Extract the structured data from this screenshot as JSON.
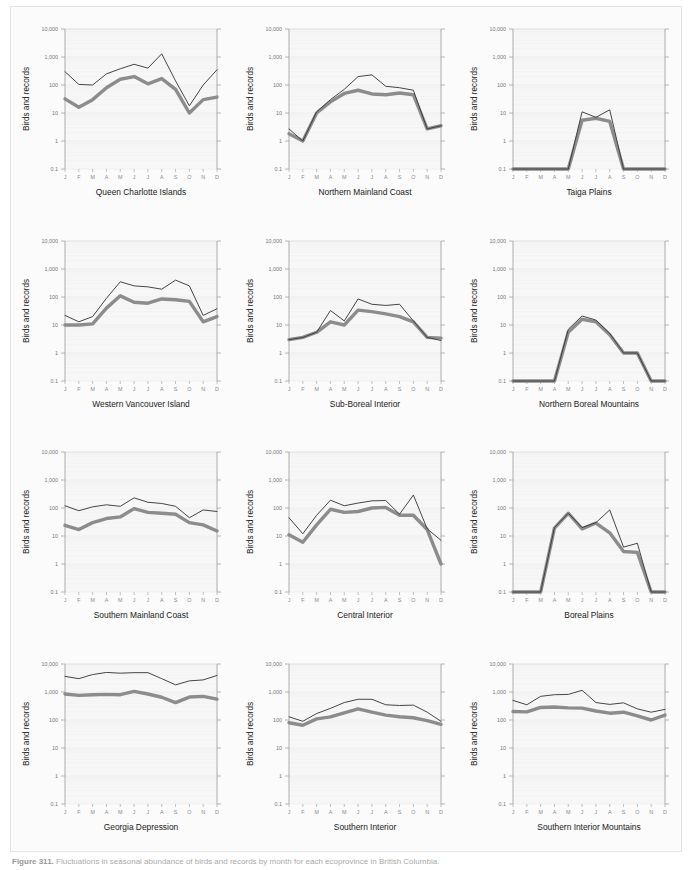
{
  "figure": {
    "caption_number": "Figure 311.",
    "caption_text": "Fluctuations in seasonal abundance of birds and records by month for each ecoprovince in British Columbia.",
    "y_axis_label": "Birds and records",
    "y_ticks": [
      "10,000",
      "1,000",
      "100",
      "10",
      "1",
      "0.1"
    ],
    "y_values": [
      10000,
      1000,
      100,
      10,
      1,
      0.1
    ],
    "x_ticks": [
      "J",
      "F",
      "M",
      "A",
      "M",
      "J",
      "J",
      "A",
      "S",
      "O",
      "N",
      "D"
    ],
    "colors": {
      "records_line": "#3b3b3b",
      "birds_line": "#8c8c8c",
      "panel_background": "#f7f7f7",
      "grid": "#ebebeb",
      "axis": "#9a9a9a"
    },
    "series_names": {
      "thin": "Records",
      "thick": "Birds"
    }
  },
  "chart_data": [
    {
      "type": "line",
      "title": "Queen Charlotte Islands",
      "xlabel": "",
      "ylabel": "Birds and records",
      "ylim": [
        0.1,
        10000
      ],
      "yscale": "log",
      "grid": true,
      "categories": [
        "J",
        "F",
        "M",
        "A",
        "M",
        "J",
        "J",
        "A",
        "S",
        "O",
        "N",
        "D"
      ],
      "series": [
        {
          "name": "Records",
          "values": [
            300,
            105,
            100,
            250,
            380,
            550,
            400,
            1300,
            140,
            18,
            100,
            350
          ]
        },
        {
          "name": "Birds",
          "values": [
            32,
            16,
            30,
            80,
            160,
            200,
            110,
            170,
            70,
            10,
            30,
            37
          ]
        }
      ]
    },
    {
      "type": "line",
      "title": "Northern Mainland Coast",
      "xlabel": "",
      "ylabel": "Birds and records",
      "ylim": [
        0.1,
        10000
      ],
      "yscale": "log",
      "grid": true,
      "categories": [
        "J",
        "F",
        "M",
        "A",
        "M",
        "J",
        "J",
        "A",
        "S",
        "O",
        "N",
        "D"
      ],
      "series": [
        {
          "name": "Records",
          "values": [
            2.7,
            1.0,
            11,
            30,
            70,
            200,
            230,
            90,
            80,
            65,
            2.7,
            3.5
          ]
        },
        {
          "name": "Birds",
          "values": [
            1.8,
            1.0,
            10,
            25,
            50,
            65,
            48,
            45,
            52,
            45,
            2.7,
            3.5
          ]
        }
      ]
    },
    {
      "type": "line",
      "title": "Taiga Plains",
      "xlabel": "",
      "ylabel": "Birds and records",
      "ylim": [
        0.1,
        10000
      ],
      "yscale": "log",
      "grid": true,
      "categories": [
        "J",
        "F",
        "M",
        "A",
        "M",
        "J",
        "J",
        "A",
        "S",
        "O",
        "N",
        "D"
      ],
      "series": [
        {
          "name": "Records",
          "values": [
            0.1,
            0.1,
            0.1,
            0.1,
            0.1,
            11,
            7,
            13,
            0.1,
            0.1,
            0.1,
            0.1
          ]
        },
        {
          "name": "Birds",
          "values": [
            0.1,
            0.1,
            0.1,
            0.1,
            0.1,
            5.5,
            6.5,
            5,
            0.1,
            0.1,
            0.1,
            0.1
          ]
        }
      ]
    },
    {
      "type": "line",
      "title": "Western Vancouver Island",
      "xlabel": "",
      "ylabel": "Birds and records",
      "ylim": [
        0.1,
        10000
      ],
      "yscale": "log",
      "grid": true,
      "categories": [
        "J",
        "F",
        "M",
        "A",
        "M",
        "J",
        "J",
        "A",
        "S",
        "O",
        "N",
        "D"
      ],
      "series": [
        {
          "name": "Records",
          "values": [
            22,
            13,
            20,
            90,
            350,
            250,
            230,
            190,
            400,
            250,
            22,
            38
          ]
        },
        {
          "name": "Birds",
          "values": [
            10,
            10,
            11,
            40,
            110,
            65,
            60,
            85,
            80,
            70,
            13,
            20
          ]
        }
      ]
    },
    {
      "type": "line",
      "title": "Sub-Boreal Interior",
      "xlabel": "",
      "ylabel": "Birds and records",
      "ylim": [
        0.1,
        10000
      ],
      "yscale": "log",
      "grid": true,
      "categories": [
        "J",
        "F",
        "M",
        "A",
        "M",
        "J",
        "J",
        "A",
        "S",
        "O",
        "N",
        "D"
      ],
      "series": [
        {
          "name": "Records",
          "values": [
            3,
            3.6,
            5.5,
            33,
            14,
            85,
            55,
            50,
            55,
            14,
            3.6,
            2.8
          ]
        },
        {
          "name": "Birds",
          "values": [
            3,
            3.6,
            5.5,
            13,
            10,
            34,
            30,
            25,
            20,
            13,
            3.6,
            3.4
          ]
        }
      ]
    },
    {
      "type": "line",
      "title": "Northern Boreal Mountains",
      "xlabel": "",
      "ylabel": "Birds and records",
      "ylim": [
        0.1,
        10000
      ],
      "yscale": "log",
      "grid": true,
      "categories": [
        "J",
        "F",
        "M",
        "A",
        "M",
        "J",
        "J",
        "A",
        "S",
        "O",
        "N",
        "D"
      ],
      "series": [
        {
          "name": "Records",
          "values": [
            0.1,
            0.1,
            0.1,
            0.1,
            7,
            21,
            15,
            5,
            1,
            1,
            0.1,
            0.1
          ]
        },
        {
          "name": "Birds",
          "values": [
            0.1,
            0.1,
            0.1,
            0.1,
            5.5,
            16,
            13,
            4.5,
            1,
            1,
            0.1,
            0.1
          ]
        }
      ]
    },
    {
      "type": "line",
      "title": "Southern Mainland Coast",
      "xlabel": "",
      "ylabel": "Birds and records",
      "ylim": [
        0.1,
        10000
      ],
      "yscale": "log",
      "grid": true,
      "categories": [
        "J",
        "F",
        "M",
        "A",
        "M",
        "J",
        "J",
        "A",
        "S",
        "O",
        "N",
        "D"
      ],
      "series": [
        {
          "name": "Records",
          "values": [
            120,
            80,
            110,
            130,
            115,
            230,
            160,
            145,
            115,
            45,
            85,
            75
          ]
        },
        {
          "name": "Birds",
          "values": [
            24,
            17,
            30,
            42,
            48,
            95,
            70,
            65,
            60,
            30,
            25,
            15
          ]
        }
      ]
    },
    {
      "type": "line",
      "title": "Central Interior",
      "xlabel": "",
      "ylabel": "Birds and records",
      "ylim": [
        0.1,
        10000
      ],
      "yscale": "log",
      "grid": true,
      "categories": [
        "J",
        "F",
        "M",
        "A",
        "M",
        "J",
        "J",
        "A",
        "S",
        "O",
        "N",
        "D"
      ],
      "series": [
        {
          "name": "Records",
          "values": [
            45,
            12,
            55,
            190,
            120,
            150,
            180,
            185,
            60,
            290,
            18,
            7,
            12
          ]
        },
        {
          "name": "Birds",
          "values": [
            11,
            6,
            25,
            90,
            70,
            75,
            100,
            105,
            55,
            55,
            17,
            1,
            4.2
          ]
        }
      ]
    },
    {
      "type": "line",
      "title": "Boreal Plains",
      "xlabel": "",
      "ylabel": "Birds and records",
      "ylim": [
        0.1,
        10000
      ],
      "yscale": "log",
      "grid": true,
      "categories": [
        "J",
        "F",
        "M",
        "A",
        "M",
        "J",
        "J",
        "A",
        "S",
        "O",
        "N",
        "D"
      ],
      "series": [
        {
          "name": "Records",
          "values": [
            0.1,
            0.1,
            0.1,
            20,
            65,
            20,
            30,
            85,
            4,
            5.5,
            0.1,
            0.1
          ]
        },
        {
          "name": "Birds",
          "values": [
            0.1,
            0.1,
            0.1,
            19,
            65,
            18,
            29,
            13,
            2.8,
            2.6,
            0.1,
            0.1
          ]
        }
      ]
    },
    {
      "type": "line",
      "title": "Georgia Depression",
      "xlabel": "",
      "ylabel": "Birds and records",
      "ylim": [
        0.1,
        10000
      ],
      "yscale": "log",
      "grid": true,
      "categories": [
        "J",
        "F",
        "M",
        "A",
        "M",
        "J",
        "J",
        "A",
        "S",
        "O",
        "N",
        "D"
      ],
      "series": [
        {
          "name": "Records",
          "values": [
            3600,
            3000,
            4200,
            5000,
            4700,
            4900,
            4900,
            3000,
            1800,
            2500,
            2700,
            3900
          ]
        },
        {
          "name": "Birds",
          "values": [
            850,
            760,
            800,
            820,
            800,
            1050,
            850,
            650,
            420,
            660,
            700,
            560
          ]
        }
      ]
    },
    {
      "type": "line",
      "title": "Southern Interior",
      "xlabel": "",
      "ylabel": "Birds and records",
      "ylim": [
        0.1,
        10000
      ],
      "yscale": "log",
      "grid": true,
      "categories": [
        "J",
        "F",
        "M",
        "A",
        "M",
        "J",
        "J",
        "A",
        "S",
        "O",
        "N",
        "D"
      ],
      "series": [
        {
          "name": "Records",
          "values": [
            130,
            90,
            170,
            260,
            420,
            550,
            550,
            350,
            330,
            340,
            190,
            90,
            230
          ]
        },
        {
          "name": "Birds",
          "values": [
            80,
            65,
            110,
            130,
            180,
            250,
            190,
            150,
            130,
            120,
            95,
            70,
            100
          ]
        }
      ]
    },
    {
      "type": "line",
      "title": "Southern Interior Mountains",
      "xlabel": "",
      "ylabel": "Birds and records",
      "ylim": [
        0.1,
        10000
      ],
      "yscale": "log",
      "grid": true,
      "categories": [
        "J",
        "F",
        "M",
        "A",
        "M",
        "J",
        "J",
        "A",
        "S",
        "O",
        "N",
        "D"
      ],
      "series": [
        {
          "name": "Records",
          "values": [
            500,
            350,
            700,
            800,
            820,
            1150,
            420,
            360,
            410,
            250,
            190,
            240
          ]
        },
        {
          "name": "Birds",
          "values": [
            200,
            195,
            280,
            290,
            270,
            265,
            210,
            175,
            190,
            140,
            100,
            150
          ]
        }
      ]
    }
  ]
}
